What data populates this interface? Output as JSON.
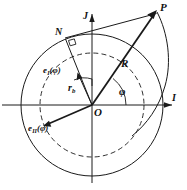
{
  "figure": {
    "type": "geometry-diagram",
    "background": "#ffffff",
    "stroke_color": "#1a1a1a",
    "width": 187,
    "height": 190
  },
  "axes": {
    "origin_label": "O",
    "horizontal_label": "I",
    "vertical_label": "J",
    "origin_px": [
      92,
      105
    ]
  },
  "points": {
    "p_label": "P",
    "p_px": [
      157,
      12
    ],
    "n_label": "N",
    "n_px": [
      65,
      38
    ]
  },
  "vectors": {
    "radius_label": "R",
    "basis_first": {
      "symbol": "e",
      "subscript": "I",
      "argument": "(φ)"
    },
    "basis_second": {
      "symbol": "e",
      "subscript": "II",
      "argument": "(φ)"
    }
  },
  "measures": {
    "base_radius_symbol": "r",
    "base_radius_subscript": "b",
    "angle_label": "φ"
  },
  "circles": {
    "outer_radius": 71,
    "base_radius": 52,
    "base_circle_dashed": true
  }
}
